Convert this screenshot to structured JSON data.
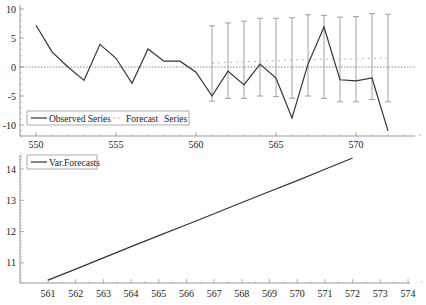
{
  "chart_data": [
    {
      "type": "line",
      "title": "",
      "xlabel": "",
      "ylabel": "",
      "xlim": [
        549,
        574
      ],
      "ylim": [
        -12,
        10.5
      ],
      "x_ticks": [
        550,
        555,
        560,
        565,
        570
      ],
      "y_ticks": [
        10,
        5,
        0,
        -5,
        -10
      ],
      "y_tick_labels": [
        "10",
        "5",
        "0",
        "-5",
        "-10"
      ],
      "x_tick_labels": [
        "550",
        "555",
        "560",
        "565",
        "570"
      ],
      "reference_line": 0,
      "legend": {
        "placement": "bottom-left",
        "entries": [
          "Observed Series",
          "Forecast",
          "Series"
        ]
      },
      "series": [
        {
          "name": "Observed Series",
          "style": "solid",
          "x": [
            550,
            551,
            552,
            553,
            554,
            555,
            556,
            557,
            558,
            559,
            560,
            561,
            562,
            563,
            564,
            565,
            566,
            567,
            568,
            569,
            570,
            571,
            572
          ],
          "values": [
            7.2,
            2.6,
            0.0,
            -2.3,
            3.9,
            1.5,
            -2.8,
            3.1,
            1.0,
            1.0,
            -0.9,
            -5.0,
            -0.7,
            -3.1,
            0.5,
            -1.9,
            -8.8,
            0.5,
            6.9,
            -2.2,
            -2.4,
            -1.9,
            -11.0
          ]
        },
        {
          "name": "Forecast Series",
          "style": "dotted",
          "x": [
            561,
            562,
            563,
            564,
            565,
            566,
            567,
            568,
            569,
            570,
            571,
            572
          ],
          "values": [
            0.6,
            0.8,
            0.9,
            1.0,
            1.1,
            1.2,
            1.3,
            1.3,
            1.4,
            1.4,
            1.5,
            1.5
          ],
          "upper": [
            7.1,
            7.6,
            7.9,
            8.4,
            8.4,
            8.5,
            9.0,
            8.9,
            8.6,
            8.7,
            9.2,
            9.1
          ],
          "lower": [
            -5.9,
            -5.4,
            -5.4,
            -5.0,
            -5.1,
            -5.4,
            -5.0,
            -5.4,
            -6.0,
            -6.0,
            -5.6,
            -6.0
          ]
        }
      ]
    },
    {
      "type": "line",
      "title": "",
      "xlabel": "",
      "ylabel": "",
      "xlim": [
        560.3,
        574
      ],
      "ylim": [
        10.4,
        14.5
      ],
      "x_ticks": [
        561,
        562,
        563,
        564,
        565,
        566,
        567,
        568,
        569,
        570,
        571,
        572,
        573,
        574
      ],
      "x_tick_labels": [
        "561",
        "562",
        "563",
        "564",
        "565",
        "566",
        "567",
        "568",
        "569",
        "570",
        "571",
        "572",
        "573",
        "574"
      ],
      "y_ticks": [
        14,
        13,
        12,
        11
      ],
      "y_tick_labels": [
        "14",
        "13",
        "12",
        "11"
      ],
      "legend": {
        "placement": "top-left",
        "entries": [
          "Var.Forecasts"
        ]
      },
      "series": [
        {
          "name": "Var.Forecasts",
          "style": "solid",
          "x": [
            561,
            562,
            563,
            564,
            565,
            566,
            567,
            568,
            569,
            570,
            571,
            572
          ],
          "values": [
            10.45,
            10.8,
            11.16,
            11.52,
            11.87,
            12.22,
            12.57,
            12.93,
            13.28,
            13.63,
            13.99,
            14.35
          ]
        }
      ]
    }
  ],
  "colors": {
    "line": "#333333",
    "axis": "#999999",
    "grid_ref": "#888888",
    "errorbar": "#8a8a8a"
  }
}
